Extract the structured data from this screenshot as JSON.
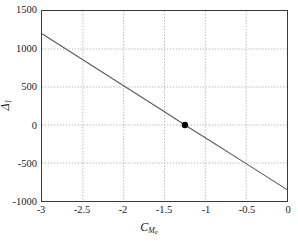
{
  "figure": {
    "background": "#ffffff",
    "frame_color": "#3a3a3a",
    "grid_color": "#9a9a9a",
    "line_color": "#5a5a5a",
    "marker_color": "#000000"
  },
  "axis": {
    "y_label_base": "Δ",
    "y_label_sub": "1",
    "x_label_base": "C",
    "x_label_sub": "M",
    "x_label_subsub": "α",
    "x_ticks": [
      "-3",
      "-2.5",
      "-2",
      "-1.5",
      "-1",
      "-0.5",
      "0"
    ],
    "y_ticks": [
      "1500",
      "1000",
      "500",
      "0",
      "-500",
      "-1000"
    ]
  },
  "chart_data": {
    "type": "line",
    "title": "",
    "xlabel": "C_Malpha",
    "ylabel": "Delta_1",
    "xlim": [
      -3,
      0
    ],
    "ylim": [
      -1000,
      1500
    ],
    "xticks": [
      -3,
      -2.5,
      -2,
      -1.5,
      -1,
      -0.5,
      0
    ],
    "yticks": [
      -1000,
      -500,
      0,
      500,
      1000,
      1500
    ],
    "grid": true,
    "legend": "none",
    "series": [
      {
        "name": "Delta_1 vs C_Malpha",
        "kind": "line",
        "x": [
          -3,
          -2.5,
          -2,
          -1.5,
          -1.25,
          -1,
          -0.5,
          0
        ],
        "y": [
          1200,
          858,
          517,
          175,
          0,
          -167,
          -508,
          -850
        ]
      },
      {
        "name": "trim point",
        "kind": "scatter",
        "x": [
          -1.25
        ],
        "y": [
          0
        ]
      }
    ]
  }
}
